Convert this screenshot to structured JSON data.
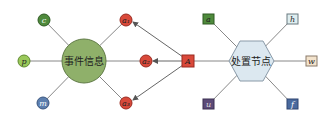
{
  "event_node": {
    "label": "事件信息",
    "color": "#8fb06a"
  },
  "handle_node": {
    "label": "处置节点",
    "color": "#dce8f0"
  },
  "left_nodes": [
    {
      "id": "c",
      "label": "c",
      "color": "#4f8a3c"
    },
    {
      "id": "p",
      "label": "p",
      "color": "#9ac85a"
    },
    {
      "id": "m",
      "label": "m",
      "color": "#5d7fae"
    }
  ],
  "action_nodes": [
    {
      "id": "a1",
      "label": "a₁",
      "color": "#d9493a"
    },
    {
      "id": "a2",
      "label": "a₂",
      "color": "#d9493a"
    },
    {
      "id": "a3",
      "label": "a₃",
      "color": "#d9493a"
    }
  ],
  "agent_node": {
    "label": "A",
    "color": "#d9493a"
  },
  "right_nodes": [
    {
      "id": "a",
      "label": "a",
      "color": "#4f8a3c"
    },
    {
      "id": "h",
      "label": "h",
      "color": "#dfeef0"
    },
    {
      "id": "w",
      "label": "w",
      "color": "#f3e3cc"
    },
    {
      "id": "u",
      "label": "u",
      "color": "#5c4a78"
    },
    {
      "id": "f",
      "label": "f",
      "color": "#4a6a9e"
    }
  ]
}
